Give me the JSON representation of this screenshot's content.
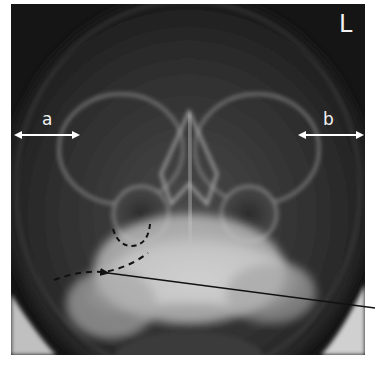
{
  "figure": {
    "type": "radiograph",
    "view": "frontal skull / sinus view",
    "labels": {
      "side_marker": "L",
      "measure_a": "a",
      "measure_b": "b"
    },
    "annotations": [
      {
        "kind": "double-arrow",
        "label": "a",
        "from": [
          14,
          135
        ],
        "to": [
          80,
          135
        ],
        "color": "#ffffff"
      },
      {
        "kind": "double-arrow",
        "label": "b",
        "from": [
          298,
          135
        ],
        "to": [
          364,
          135
        ],
        "color": "#ffffff"
      },
      {
        "kind": "dashed-curve",
        "description": "outline of maxillary sinus floor",
        "color": "#111111"
      },
      {
        "kind": "dashed-curve",
        "description": "traced line toward zygomatic region",
        "color": "#111111"
      },
      {
        "kind": "pointer-line",
        "from": [
          375,
          308
        ],
        "to": [
          107,
          273
        ],
        "color": "#111111"
      }
    ],
    "colors": {
      "background": "#151515",
      "bone": "#d8d8d8",
      "annotation_white": "#ffffff",
      "annotation_black": "#111111"
    }
  }
}
